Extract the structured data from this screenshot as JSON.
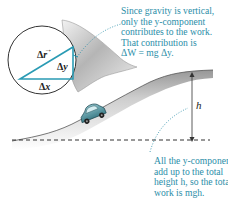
{
  "figure": {
    "type": "physics-diagram",
    "colors": {
      "annotation_text": "#2a8ea8",
      "triangle": "#2a9bb4",
      "hill_shade": "#9a9a9a",
      "car_body": "#5f9ea8",
      "dotted_leader": "#2a8ea8",
      "dimension_line": "#333333"
    },
    "inset": {
      "labels": {
        "hypotenuse": "Δr⃗",
        "vertical": "Δy",
        "horizontal": "Δx"
      }
    },
    "height_label": "h",
    "annotation_top": {
      "lines": [
        "Since gravity is vertical,",
        "only the y-component",
        "contributes to the work.",
        "That contribution is",
        "ΔW = mg Δy."
      ]
    },
    "annotation_bottom": {
      "lines": [
        "All the y-components",
        "add up to the total",
        "height h, so the total",
        "work is mgh."
      ]
    }
  }
}
